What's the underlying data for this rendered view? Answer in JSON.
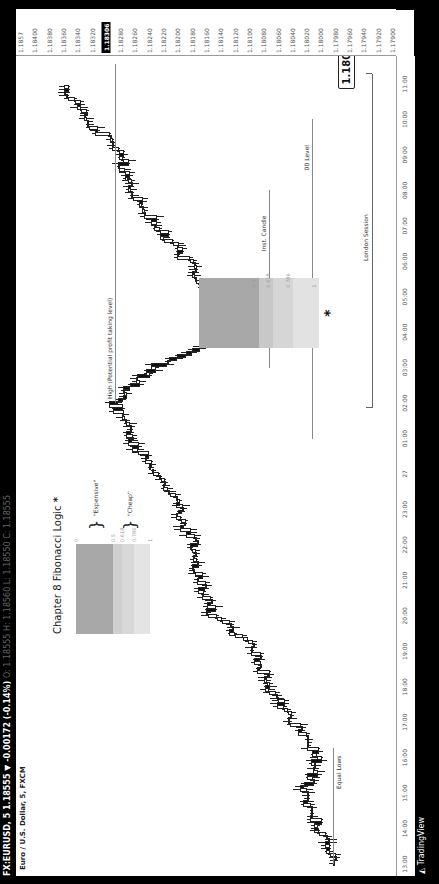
{
  "header": {
    "symbol_line": "FX:EURUSD, 5  1.18555 ▼ -0.00172 (-0.14%)",
    "ohlc": "O: 1.18555  H: 1.18560  L: 1.18550  C: 1.18555",
    "subtitle": "Euro / U.S. Dollar, 5, FXCM"
  },
  "footer": {
    "brand": "TradingView",
    "brand_icon": "tradingview-logo-icon"
  },
  "legend": {
    "title": "Chapter 8 Fibonacci Logic",
    "star": "*",
    "levels": [
      "0",
      "0.5",
      "0.618",
      "0.786",
      "1"
    ],
    "expensive_label": "\"Expensive\"",
    "cheap_label": "\"Cheap\"",
    "colors": {
      "expensive": "#a8a8a8",
      "mid": "#cfcfcf",
      "cheap": "#e0e0e0"
    }
  },
  "annotations": {
    "high_label": "High (Potential profit taking level)",
    "equal_lows": "Equal Lows",
    "inst_candle": "Inst. Candle",
    "zero_level": "00 Level",
    "london_session": "London Session",
    "callout_price": "1.18000",
    "entry_star": "*",
    "fib_levels": [
      "0.5",
      "0.618",
      "0.786",
      "1"
    ]
  },
  "chart_data": {
    "type": "candlestick",
    "title": "FX:EURUSD, 5",
    "subtitle": "Euro / U.S. Dollar, 5, FXCM",
    "xlabel": "",
    "ylabel": "",
    "x_ticks": [
      "13:00",
      "14:00",
      "15:00",
      "16:00",
      "17:00",
      "18:00",
      "19:00",
      "20:00",
      "21:00",
      "22:00",
      "23:00",
      "27",
      "01:00",
      "02:00",
      "03:00",
      "04:00",
      "05:00",
      "06:00",
      "07:00",
      "08:00",
      "09:00",
      "10:00",
      "11:00"
    ],
    "y_ticks": [
      "1.1857",
      "1.18400",
      "1.18380",
      "1.18360",
      "1.18340",
      "1.18320",
      "1.18306",
      "1.18280",
      "1.18260",
      "1.18240",
      "1.18220",
      "1.18200",
      "1.18180",
      "1.18160",
      "1.18140",
      "1.18120",
      "1.18100",
      "1.18080",
      "1.18060",
      "1.18040",
      "1.18020",
      "1.18000",
      "1.17980",
      "1.17960",
      "1.17940",
      "1.17920",
      "1.17900"
    ],
    "current_price": "1.18306",
    "ylim": [
      1.1788,
      1.1842
    ],
    "grid": false,
    "approx_path": [
      {
        "t": "13:00",
        "price": 1.1797
      },
      {
        "t": "14:00",
        "price": 1.1799
      },
      {
        "t": "15:00",
        "price": 1.1801
      },
      {
        "t": "16:00",
        "price": 1.1799
      },
      {
        "t": "17:00",
        "price": 1.1803
      },
      {
        "t": "18:00",
        "price": 1.1806
      },
      {
        "t": "19:00",
        "price": 1.1808
      },
      {
        "t": "20:00",
        "price": 1.1814
      },
      {
        "t": "21:00",
        "price": 1.1816
      },
      {
        "t": "22:00",
        "price": 1.1817
      },
      {
        "t": "23:00",
        "price": 1.1819
      },
      {
        "t": "27",
        "price": 1.1822
      },
      {
        "t": "01:00",
        "price": 1.1826
      },
      {
        "t": "02:00",
        "price": 1.1828
      },
      {
        "t": "03:00",
        "price": 1.1822
      },
      {
        "t": "04:00",
        "price": 1.1809
      },
      {
        "t": "05:00",
        "price": 1.1814
      },
      {
        "t": "06:00",
        "price": 1.1818
      },
      {
        "t": "07:00",
        "price": 1.1822
      },
      {
        "t": "08:00",
        "price": 1.1826
      },
      {
        "t": "09:00",
        "price": 1.1827
      },
      {
        "t": "10:00",
        "price": 1.1832
      },
      {
        "t": "11:00",
        "price": 1.1836
      }
    ],
    "horizontal_levels": [
      {
        "label": "High (Potential profit taking level)",
        "price": 1.1828
      },
      {
        "label": "Equal Lows",
        "price": 1.1797
      },
      {
        "label": "00 Level",
        "price": 1.18
      }
    ],
    "fib_retracement": {
      "levels": [
        0.5,
        0.618,
        0.786,
        1
      ]
    },
    "sessions": [
      {
        "label": "London Session",
        "from": "02:00",
        "to": "11:00"
      }
    ]
  }
}
